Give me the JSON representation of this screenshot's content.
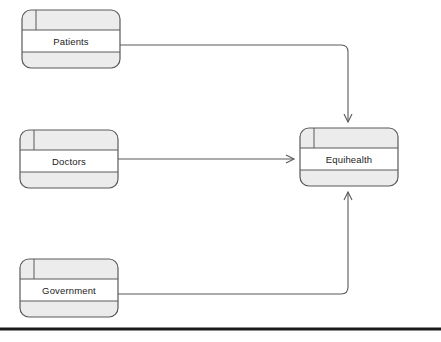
{
  "diagram": {
    "type": "actor-context-diagram",
    "canvas": {
      "width": 441,
      "height": 342,
      "background": "#ffffff"
    },
    "style": {
      "node_fill_band": "#ececec",
      "node_fill_center": "#ffffff",
      "node_stroke": "#5a5a5a",
      "connector_stroke": "#5a5a5a",
      "baseline_stroke": "#1a1a1a",
      "label_color": "#1b1b1b"
    },
    "nodes": [
      {
        "id": "patients",
        "label": "Patients",
        "x": 22,
        "y": 10,
        "width": 98,
        "height": 58,
        "band_top": 20,
        "band_bottom": 16,
        "tab_width": 14
      },
      {
        "id": "doctors",
        "label": "Doctors",
        "x": 20,
        "y": 130,
        "width": 98,
        "height": 58,
        "band_top": 20,
        "band_bottom": 16,
        "tab_width": 14
      },
      {
        "id": "government",
        "label": "Government",
        "x": 20,
        "y": 259,
        "width": 98,
        "height": 58,
        "band_top": 20,
        "band_bottom": 16,
        "tab_width": 14
      },
      {
        "id": "equihealth",
        "label": "Equihealth",
        "x": 300,
        "y": 128,
        "width": 98,
        "height": 58,
        "band_top": 20,
        "band_bottom": 16,
        "tab_width": 14
      }
    ],
    "connectors": [
      {
        "id": "patients-to-equihealth",
        "from": "patients",
        "to": "equihealth",
        "arrowhead": "open-v",
        "direction": "down",
        "path": "M 120 45 L 341 45 Q 348 45 348 52 L 348 122"
      },
      {
        "id": "doctors-to-equihealth",
        "from": "doctors",
        "to": "equihealth",
        "arrowhead": "open-v",
        "direction": "right",
        "path": "M 118 159 L 294 159"
      },
      {
        "id": "government-to-equihealth",
        "from": "government",
        "to": "equihealth",
        "arrowhead": "open-v",
        "direction": "up",
        "path": "M 118 294 L 341 294 Q 348 294 348 287 L 348 192"
      }
    ],
    "baseline": {
      "id": "footer-rule",
      "x1": 0,
      "x2": 441,
      "y": 329,
      "thickness": 3
    }
  }
}
